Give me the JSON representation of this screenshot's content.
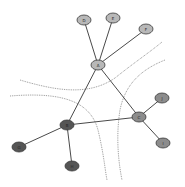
{
  "diagram": {
    "type": "network-graph",
    "colors": {
      "edge": "#4a4a4a",
      "separator": "#8a8a8a",
      "node_stroke": "#3a3a3a",
      "light": "#b8b8b8",
      "medium": "#8c8c8c",
      "dark": "#555555"
    },
    "nodes": [
      {
        "id": "D",
        "label": "D",
        "x": 84,
        "y": 20,
        "shade": "light"
      },
      {
        "id": "E",
        "label": "E",
        "x": 113,
        "y": 18,
        "shade": "light"
      },
      {
        "id": "F",
        "label": "F",
        "x": 146,
        "y": 29,
        "shade": "light"
      },
      {
        "id": "A",
        "label": "A",
        "x": 98,
        "y": 65,
        "shade": "light"
      },
      {
        "id": "B",
        "label": "B",
        "x": 67,
        "y": 125,
        "shade": "dark"
      },
      {
        "id": "C",
        "label": "C",
        "x": 139,
        "y": 117,
        "shade": "medium"
      },
      {
        "id": "G",
        "label": "G",
        "x": 19,
        "y": 147,
        "shade": "dark"
      },
      {
        "id": "H",
        "label": "H",
        "x": 72,
        "y": 166,
        "shade": "dark"
      },
      {
        "id": "J",
        "label": "J",
        "x": 162,
        "y": 98,
        "shade": "medium"
      },
      {
        "id": "I",
        "label": "I",
        "x": 163,
        "y": 143,
        "shade": "medium"
      }
    ],
    "edges": [
      {
        "from": "A",
        "to": "D"
      },
      {
        "from": "A",
        "to": "E"
      },
      {
        "from": "A",
        "to": "F"
      },
      {
        "from": "A",
        "to": "B"
      },
      {
        "from": "A",
        "to": "C"
      },
      {
        "from": "B",
        "to": "C"
      },
      {
        "from": "B",
        "to": "G"
      },
      {
        "from": "B",
        "to": "H"
      },
      {
        "from": "C",
        "to": "J"
      },
      {
        "from": "C",
        "to": "I"
      }
    ],
    "separators": [
      {
        "name": "boundary-1",
        "path": "M20,80 C60,92 90,95 115,78 C135,62 150,52 162,42"
      },
      {
        "name": "boundary-2",
        "path": "M10,96 C60,92 90,100 98,130 C104,155 105,170 107,180"
      },
      {
        "name": "boundary-3",
        "path": "M165,60 C140,70 125,85 120,110 C116,135 118,160 122,180"
      }
    ]
  }
}
